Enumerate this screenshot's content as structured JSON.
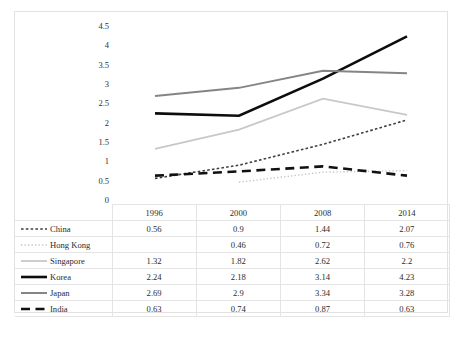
{
  "chart_data": {
    "type": "line",
    "title": "",
    "subtitle": "",
    "xlabel": "",
    "ylabel": "",
    "x": [
      "1996",
      "2000",
      "2008",
      "2014"
    ],
    "categories": [
      "1996",
      "2000",
      "2008",
      "2014"
    ],
    "ylim": [
      0,
      4.5
    ],
    "yticks": [
      "0",
      "0.5",
      "1",
      "1.5",
      "2",
      "2.5",
      "3",
      "3.5",
      "4",
      "4.5"
    ],
    "ytick_values": [
      0,
      0.5,
      1,
      1.5,
      2,
      2.5,
      3,
      3.5,
      4,
      4.5
    ],
    "grid": false,
    "legend_position": "row-labels-in-table",
    "series": [
      {
        "name": "China",
        "values": [
          0.56,
          0.9,
          1.44,
          2.07
        ],
        "display": [
          "0.56",
          "0.9",
          "1.44",
          "2.07"
        ],
        "style": "fine-dashed",
        "color": "#404040",
        "width": 1.6
      },
      {
        "name": "Hong Kong",
        "values": [
          null,
          0.46,
          0.72,
          0.76
        ],
        "display": [
          "",
          "0.46",
          "0.72",
          "0.76"
        ],
        "style": "dotted",
        "color": "#c4c4c4",
        "width": 1.4
      },
      {
        "name": "Singapore",
        "values": [
          1.32,
          1.82,
          2.62,
          2.2
        ],
        "display": [
          "1.32",
          "1.82",
          "2.62",
          "2.2"
        ],
        "style": "solid",
        "color": "#c8c8c8",
        "width": 1.8
      },
      {
        "name": "Korea",
        "values": [
          2.24,
          2.18,
          3.14,
          4.23
        ],
        "display": [
          "2.24",
          "2.18",
          "3.14",
          "4.23"
        ],
        "style": "solid",
        "color": "#0d0d0d",
        "width": 2.6
      },
      {
        "name": "Japan",
        "values": [
          2.69,
          2.9,
          3.34,
          3.28
        ],
        "display": [
          "2.69",
          "2.9",
          "3.34",
          "3.28"
        ],
        "style": "solid",
        "color": "#858585",
        "width": 2.0
      },
      {
        "name": "India",
        "values": [
          0.63,
          0.74,
          0.87,
          0.63
        ],
        "display": [
          "0.63",
          "0.74",
          "0.87",
          "0.63"
        ],
        "style": "bold-dashed",
        "color": "#111111",
        "width": 2.6
      }
    ]
  },
  "table": {
    "corner_label": "",
    "column_headers": [
      "1996",
      "2000",
      "2008",
      "2014"
    ],
    "rows": [
      {
        "label": "China",
        "values": [
          "0.56",
          "0.9",
          "1.44",
          "2.07"
        ]
      },
      {
        "label": "Hong Kong",
        "values": [
          "",
          "0.46",
          "0.72",
          "0.76"
        ]
      },
      {
        "label": "Singapore",
        "values": [
          "1.32",
          "1.82",
          "2.62",
          "2.2"
        ]
      },
      {
        "label": "Korea",
        "values": [
          "2.24",
          "2.18",
          "3.14",
          "4.23"
        ]
      },
      {
        "label": "Japan",
        "values": [
          "2.69",
          "2.9",
          "3.34",
          "3.28"
        ]
      },
      {
        "label": "India",
        "values": [
          "0.63",
          "0.74",
          "0.87",
          "0.63"
        ]
      }
    ]
  },
  "axis": {
    "y_labels": [
      "4.5",
      "4",
      "3.5",
      "3",
      "2.5",
      "2",
      "1.5",
      "1",
      "0.5",
      "0"
    ]
  }
}
